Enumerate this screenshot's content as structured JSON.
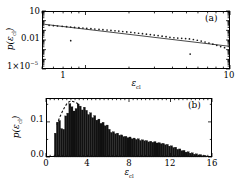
{
  "figure": {
    "panels": [
      {
        "id": "a",
        "label": "(a)",
        "chart_index": 0
      },
      {
        "id": "b",
        "label": "(b)",
        "chart_index": 1
      }
    ]
  },
  "chart_data": [
    {
      "type": "scatter",
      "panel": "(a)",
      "title": "",
      "xlabel": "ε",
      "xlabel_sub": "cl",
      "ylabel": "p(ε",
      "ylabel_sub": "cl",
      "ylabel_tail": ")",
      "xscale": "log",
      "yscale": "log",
      "xlim": [
        0.5,
        10
      ],
      "ylim": [
        1e-05,
        10
      ],
      "xticks": [
        1,
        10
      ],
      "xticklabels": [
        "1",
        "10"
      ],
      "yticks": [
        10,
        0.01,
        1e-05
      ],
      "yticklabels": [
        "10",
        "0.01",
        "1×10"
      ],
      "ytick_exponents": [
        "",
        "",
        "−5"
      ],
      "grid": false,
      "legend": "none",
      "marker": "dot",
      "marker_color": "#1a1a1a",
      "fit_line": {
        "style": "solid",
        "color": "#1a1a1a",
        "description": "power-law fit",
        "x": [
          0.52,
          10.0
        ],
        "y": [
          0.42,
          0.0022
        ]
      },
      "x": [
        0.56,
        0.6,
        0.64,
        0.69,
        0.74,
        0.79,
        0.84,
        0.79,
        0.9,
        0.96,
        1.02,
        1.09,
        1.16,
        1.24,
        1.32,
        1.41,
        1.5,
        1.6,
        1.7,
        1.81,
        1.93,
        2.06,
        2.19,
        2.33,
        2.48,
        2.64,
        2.81,
        2.99,
        3.18,
        3.39,
        3.61,
        3.84,
        4.09,
        4.35,
        4.63,
        4.93,
        5.24,
        5.58,
        5.94,
        6.32,
        6.72,
        7.15,
        7.61,
        8.1,
        8.62,
        9.17,
        5.3
      ],
      "y": [
        0.33,
        0.3,
        0.28,
        0.26,
        0.24,
        0.22,
        0.2,
        0.0085,
        0.19,
        0.175,
        0.162,
        0.15,
        0.138,
        0.127,
        0.117,
        0.108,
        0.099,
        0.091,
        0.083,
        0.076,
        0.069,
        0.062,
        0.056,
        0.05,
        0.045,
        0.0405,
        0.0362,
        0.0322,
        0.0285,
        0.0251,
        0.0219,
        0.019,
        0.017,
        0.0158,
        0.015,
        0.0142,
        0.0128,
        0.0112,
        0.0094,
        0.0078,
        0.0062,
        0.0048,
        0.0037,
        0.0028,
        0.0021,
        0.0016,
        0.00035
      ]
    },
    {
      "type": "bar",
      "panel": "(b)",
      "title": "",
      "xlabel": "ε",
      "xlabel_sub": "cl",
      "ylabel": "p(ε",
      "ylabel_sub": "cl",
      "ylabel_tail": ")",
      "xscale": "linear",
      "yscale": "linear",
      "xlim": [
        0,
        16
      ],
      "ylim": [
        0,
        0.168
      ],
      "xticks": [
        0,
        4,
        8,
        12,
        16
      ],
      "xticklabels": [
        "0",
        "4",
        "8",
        "12",
        "16"
      ],
      "yticks": [
        0.0,
        0.1
      ],
      "yticklabels": [
        "0.0",
        "0.1"
      ],
      "grid": false,
      "legend": "none",
      "bar_color": "#111111",
      "bar_width": 0.2,
      "x": [
        0.9,
        1.1,
        1.3,
        1.5,
        1.7,
        1.9,
        2.1,
        2.3,
        2.5,
        2.7,
        2.9,
        3.1,
        3.3,
        3.5,
        3.7,
        3.9,
        4.1,
        4.3,
        4.5,
        4.7,
        4.9,
        5.1,
        5.3,
        5.5,
        5.7,
        5.9,
        6.1,
        6.3,
        6.5,
        6.7,
        6.9,
        7.1,
        7.3,
        7.5,
        7.7,
        7.9,
        8.1,
        8.3,
        8.5,
        8.7,
        8.9,
        9.1,
        9.3,
        9.5,
        9.7,
        9.9,
        10.1,
        10.3,
        10.5,
        10.7,
        10.9,
        11.1,
        11.3,
        11.5,
        11.7,
        11.9,
        12.1,
        12.3,
        12.5,
        12.7,
        12.9,
        13.1,
        13.3,
        13.5,
        13.7,
        13.9,
        14.1,
        14.3,
        14.5,
        14.7,
        14.9,
        15.1,
        15.3,
        15.5
      ],
      "values": [
        0.068,
        0.099,
        0.104,
        0.081,
        0.079,
        0.117,
        0.125,
        0.152,
        0.143,
        0.131,
        0.138,
        0.151,
        0.145,
        0.134,
        0.142,
        0.133,
        0.121,
        0.126,
        0.112,
        0.118,
        0.105,
        0.108,
        0.096,
        0.099,
        0.089,
        0.091,
        0.079,
        0.07,
        0.072,
        0.066,
        0.068,
        0.062,
        0.063,
        0.058,
        0.059,
        0.055,
        0.057,
        0.052,
        0.054,
        0.05,
        0.052,
        0.047,
        0.049,
        0.046,
        0.047,
        0.043,
        0.045,
        0.042,
        0.044,
        0.04,
        0.041,
        0.038,
        0.039,
        0.035,
        0.036,
        0.031,
        0.032,
        0.027,
        0.028,
        0.022,
        0.023,
        0.018,
        0.019,
        0.014,
        0.015,
        0.011,
        0.012,
        0.008,
        0.009,
        0.006,
        0.007,
        0.004,
        0.005,
        0.003
      ],
      "overlay_curve": {
        "style": "dashed",
        "color": "#111111",
        "description": "fitted distribution on rising edge",
        "x": [
          1.05,
          1.2,
          1.4,
          1.6,
          1.8,
          2.0,
          2.2,
          2.4,
          2.6,
          2.8,
          3.0,
          3.15
        ],
        "y": [
          0.092,
          0.104,
          0.118,
          0.131,
          0.142,
          0.151,
          0.157,
          0.159,
          0.158,
          0.156,
          0.153,
          0.15
        ]
      }
    }
  ]
}
